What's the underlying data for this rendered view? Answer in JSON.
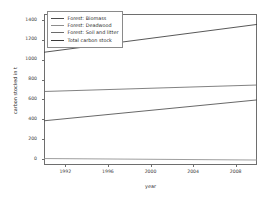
{
  "chart_data": {
    "type": "line",
    "title": "",
    "xlabel": "year",
    "ylabel": "carbon stocked in t",
    "xlim": [
      1990,
      2010
    ],
    "ylim": [
      -60,
      1460
    ],
    "xticks": [
      1992,
      1996,
      2000,
      2004,
      2008
    ],
    "yticks": [
      0,
      200,
      400,
      600,
      800,
      1000,
      1200,
      1400
    ],
    "grid": false,
    "legend_position": "upper left",
    "x": [
      1990,
      2010
    ],
    "series": [
      {
        "name": "Forest: Biomass",
        "color": "#4d4d4d",
        "values": [
          385,
          595
        ]
      },
      {
        "name": "Forest: Deadwood",
        "color": "#8c8c8c",
        "values": [
          5,
          -10
        ]
      },
      {
        "name": "Forest: Soil and litter",
        "color": "#6b6b6b",
        "values": [
          680,
          745
        ]
      },
      {
        "name": "Total carbon stock",
        "color": "#3a3a3a",
        "values": [
          1075,
          1355
        ]
      }
    ]
  },
  "legend": {
    "items": [
      {
        "label": "Forest: Biomass"
      },
      {
        "label": "Forest: Deadwood"
      },
      {
        "label": "Forest: Soil and litter"
      },
      {
        "label": "Total carbon stock"
      }
    ]
  },
  "axes": {
    "y_tick_labels": [
      "1400",
      "1200",
      "1000",
      "800",
      "600",
      "400",
      "200",
      "0"
    ],
    "x_tick_labels": [
      "1992",
      "1996",
      "2000",
      "2004",
      "2008"
    ]
  }
}
